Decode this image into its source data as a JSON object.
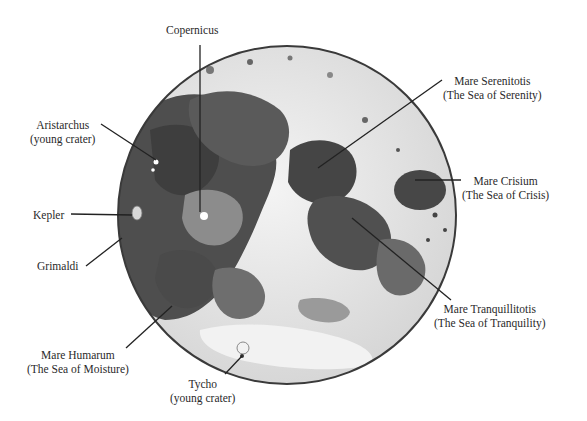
{
  "figure": {
    "colors": {
      "background": "#ffffff",
      "highlands": "#e8e8e8",
      "maria_dark": "#4a4a4a",
      "maria_mid": "#7a7a7a",
      "rim": "#3a3a3a",
      "leader_line": "#222222"
    }
  },
  "labels": {
    "copernicus": {
      "name": "Copernicus",
      "note": ""
    },
    "aristarchus": {
      "name": "Aristarchus",
      "note": "(young crater)"
    },
    "kepler": {
      "name": "Kepler",
      "note": ""
    },
    "grimaldi": {
      "name": "Grimaldi",
      "note": ""
    },
    "humarum": {
      "name": "Mare Humarum",
      "note": "(The Sea of Moisture)"
    },
    "tycho": {
      "name": "Tycho",
      "note": "(young crater)"
    },
    "serenitatis": {
      "name": "Mare Serenitotis",
      "note": "(The Sea of Serenity)"
    },
    "crisium": {
      "name": "Mare Crisium",
      "note": "(The Sea of Crisis)"
    },
    "tranquillitatis": {
      "name": "Mare Tranquillitotis",
      "note": "(The Sea of Tranquility)"
    }
  }
}
